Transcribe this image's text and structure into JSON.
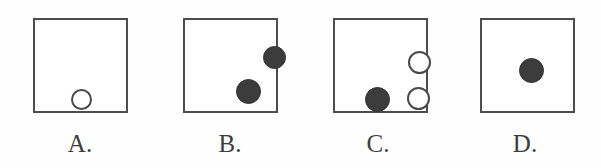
{
  "figure": {
    "type": "multiple-choice-diagram",
    "background_color": "#fefefe",
    "outline_color": "#4d4d4d",
    "filled_circle_color": "#3c3c3c",
    "open_circle_color": "#ffffff"
  },
  "panels": [
    {
      "id": "A",
      "label": "A.",
      "circle_count": 1,
      "filled_count": 0,
      "open_count": 1,
      "circles": [
        {
          "fill": "open",
          "cx": 36,
          "cy": 69,
          "d": 21
        }
      ]
    },
    {
      "id": "B",
      "label": "B.",
      "circle_count": 2,
      "filled_count": 2,
      "open_count": 0,
      "circles": [
        {
          "fill": "filled",
          "cx": 78,
          "cy": 26,
          "d": 23
        },
        {
          "fill": "filled",
          "cx": 51,
          "cy": 59,
          "d": 25
        }
      ]
    },
    {
      "id": "C",
      "label": "C.",
      "circle_count": 3,
      "filled_count": 1,
      "open_count": 2,
      "circles": [
        {
          "fill": "open",
          "cx": 73,
          "cy": 31,
          "d": 23
        },
        {
          "fill": "filled",
          "cx": 30,
          "cy": 67,
          "d": 25
        },
        {
          "fill": "open",
          "cx": 72,
          "cy": 67,
          "d": 23
        }
      ]
    },
    {
      "id": "D",
      "label": "D.",
      "circle_count": 1,
      "filled_count": 1,
      "open_count": 0,
      "circles": [
        {
          "fill": "filled",
          "cx": 37,
          "cy": 38,
          "d": 25
        }
      ]
    }
  ]
}
